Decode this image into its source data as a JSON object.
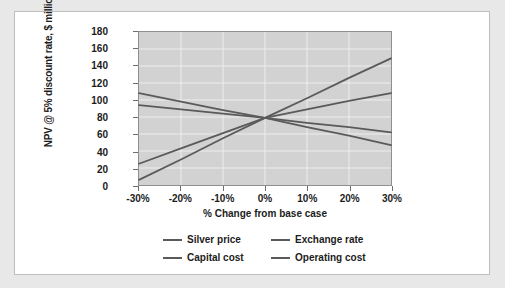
{
  "chart_data": {
    "type": "line",
    "title": "",
    "xlabel": "% Change from base case",
    "ylabel": "NPV @ 5% discount rate, $ million",
    "x": [
      -30,
      -20,
      -10,
      0,
      10,
      20,
      30
    ],
    "xtick_labels": [
      "-30%",
      "-20%",
      "-10%",
      "0%",
      "10%",
      "20%",
      "30%"
    ],
    "xlim": [
      -30,
      30
    ],
    "ylim": [
      0,
      180
    ],
    "ytick_labels": [
      "0",
      "20",
      "40",
      "60",
      "80",
      "100",
      "120",
      "140",
      "160",
      "180"
    ],
    "ytick_values": [
      0,
      20,
      40,
      60,
      80,
      100,
      120,
      140,
      160,
      180
    ],
    "grid": true,
    "legend_position": "bottom",
    "plot_background": "#d2d2d2",
    "series": [
      {
        "name": "Silver price",
        "color": "#5a5a5a",
        "values": [
          6,
          30,
          55,
          79,
          102,
          126,
          149
        ]
      },
      {
        "name": "Exchange rate",
        "color": "#5a5a5a",
        "values": [
          25,
          43,
          61,
          79,
          89,
          99,
          108
        ]
      },
      {
        "name": "Capital cost",
        "color": "#5a5a5a",
        "values": [
          108,
          98,
          88,
          79,
          68,
          58,
          47
        ]
      },
      {
        "name": "Operating cost",
        "color": "#5a5a5a",
        "values": [
          94,
          89,
          84,
          79,
          73,
          68,
          62
        ]
      }
    ]
  },
  "legend": {
    "items": [
      {
        "label": "Silver price"
      },
      {
        "label": "Exchange rate"
      },
      {
        "label": "Capital cost"
      },
      {
        "label": "Operating cost"
      }
    ]
  }
}
